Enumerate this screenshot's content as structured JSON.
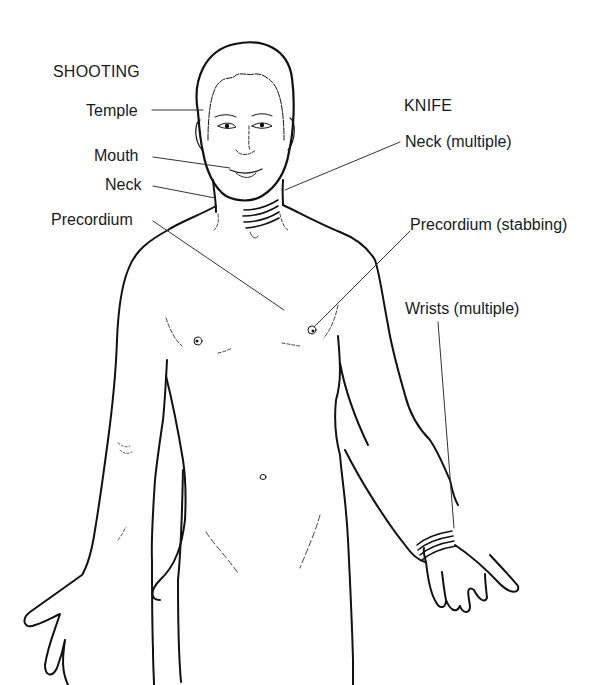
{
  "figure": {
    "type": "anatomical-diagram",
    "colors": {
      "line": "#111111",
      "leader": "#333333",
      "background": "#ffffff",
      "text": "#1a1a1a"
    }
  },
  "groups": {
    "shooting": {
      "heading": "SHOOTING",
      "sites": [
        {
          "label": "Temple"
        },
        {
          "label": "Mouth"
        },
        {
          "label": "Neck"
        },
        {
          "label": "Precordium"
        }
      ]
    },
    "knife": {
      "heading": "KNIFE",
      "sites": [
        {
          "label": "Neck (multiple)"
        },
        {
          "label": "Precordium (stabbing)"
        },
        {
          "label": "Wrists (multiple)"
        }
      ]
    }
  }
}
